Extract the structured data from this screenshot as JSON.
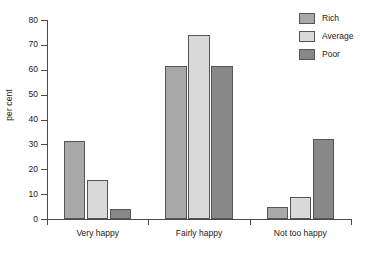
{
  "chart_data": {
    "type": "bar",
    "title": "",
    "xlabel": "",
    "ylabel": "per cent",
    "ylim": [
      0,
      80
    ],
    "ytick_step": 10,
    "yticks": [
      0,
      10,
      20,
      30,
      40,
      50,
      60,
      70,
      80
    ],
    "grid": false,
    "legend_position": "top-right",
    "categories": [
      "Very happy",
      "Fairly happy",
      "Not too happy"
    ],
    "series": [
      {
        "name": "Rich",
        "color": "#a8a8a8",
        "values": [
          31.5,
          61.5,
          5
        ]
      },
      {
        "name": "Average",
        "color": "#d9d9d9",
        "values": [
          15.5,
          74,
          9
        ]
      },
      {
        "name": "Poor",
        "color": "#888888",
        "values": [
          4,
          61.5,
          32
        ]
      }
    ]
  }
}
